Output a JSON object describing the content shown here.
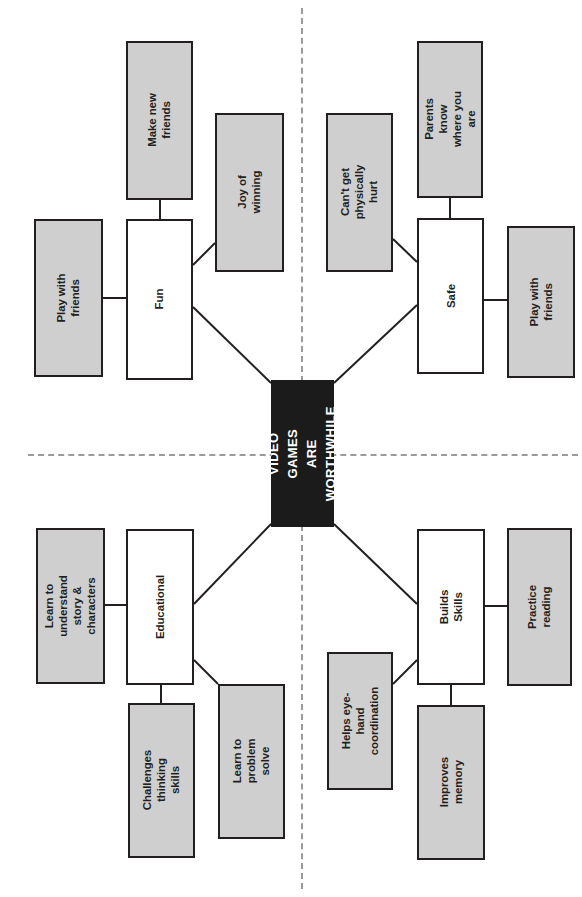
{
  "diagram": {
    "title": "VIDEO GAMES\nARE WORTHWHILE",
    "orientation": "rotated-90",
    "colors": {
      "center_fill": "#1b1b1b",
      "center_text": "#ffffff",
      "branch_fill": "#ffffff",
      "sub_fill": "#cfcfcf",
      "stroke": "#231f20",
      "divider": "#9a9a9a",
      "page_background": "#ffffff"
    },
    "center": {
      "text": "VIDEO GAMES\nARE WORTHWHILE"
    },
    "branches": [
      {
        "id": "fun",
        "label": "Fun",
        "quadrant": "top-left",
        "children": [
          {
            "id": "fun-play-with-friends",
            "label": "Play with friends"
          },
          {
            "id": "fun-make-new-friends",
            "label": "Make new friends"
          },
          {
            "id": "fun-joy-of-winning",
            "label": "Joy of winning"
          }
        ]
      },
      {
        "id": "safe",
        "label": "Safe",
        "quadrant": "top-right",
        "children": [
          {
            "id": "safe-cant-get-physically-hurt",
            "label": "Can't get\nphysically hurt"
          },
          {
            "id": "safe-parents-know-where-you-are",
            "label": "Parents know\nwhere you are"
          },
          {
            "id": "safe-play-with-friends",
            "label": "Play with friends"
          }
        ]
      },
      {
        "id": "educational",
        "label": "Educational",
        "quadrant": "bottom-left",
        "children": [
          {
            "id": "edu-learn-to-understand-story-characters",
            "label": "Learn to understand\nstory & characters"
          },
          {
            "id": "edu-challenges-thinking-skills",
            "label": "Challenges thinking skills"
          },
          {
            "id": "edu-learn-to-problem-solve",
            "label": "Learn to problem\nsolve"
          }
        ]
      },
      {
        "id": "builds-skills",
        "label": "Builds Skills",
        "quadrant": "bottom-right",
        "children": [
          {
            "id": "skills-helps-eye-hand-coordination",
            "label": "Helps eye-hand\ncoordination"
          },
          {
            "id": "skills-improves-memory",
            "label": "Improves memory"
          },
          {
            "id": "skills-practice-reading",
            "label": "Practice reading"
          }
        ]
      }
    ]
  }
}
